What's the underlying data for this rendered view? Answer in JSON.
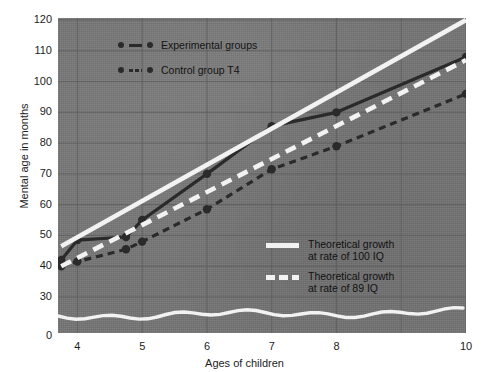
{
  "chart_data": {
    "type": "line",
    "title": "",
    "xlabel": "Ages of children",
    "ylabel": "Mental age in months",
    "xlim": [
      3.7,
      10
    ],
    "ylim": [
      30,
      120
    ],
    "yaxis_break_value": "0",
    "grid": true,
    "legend_position": "inside-top-left and inside-lower-right",
    "x_tick_labels": [
      "4",
      "5",
      "6",
      "7",
      "8",
      "10"
    ],
    "x_tick_values": [
      4,
      5,
      6,
      7,
      8,
      10
    ],
    "y_tick_labels": [
      "120",
      "110",
      "100",
      "90",
      "80",
      "70",
      "60",
      "50",
      "40",
      "30",
      "0"
    ],
    "y_tick_values": [
      120,
      110,
      100,
      90,
      80,
      70,
      60,
      50,
      40,
      30,
      0
    ],
    "series": [
      {
        "name": "Experimental groups",
        "style": "solid-dark-markers",
        "color": "#2a2a2a",
        "x": [
          3.75,
          4.0,
          4.75,
          5.0,
          6.0,
          7.0,
          8.0,
          10.0
        ],
        "values": [
          42,
          48.5,
          49.5,
          55,
          70,
          85.5,
          90,
          108
        ]
      },
      {
        "name": "Control group T4",
        "style": "dashed-dark-markers",
        "color": "#2a2a2a",
        "x": [
          3.75,
          4.0,
          4.75,
          5.0,
          6.0,
          7.0,
          8.0,
          10.0
        ],
        "values": [
          40,
          41.5,
          45.5,
          48,
          58.5,
          71.5,
          79,
          96
        ]
      },
      {
        "name": "Theoretical growth at rate of 100 IQ",
        "style": "solid-white",
        "color": "#f2f2f2",
        "x": [
          3.75,
          10.0
        ],
        "values": [
          46.5,
          120
        ]
      },
      {
        "name": "Theoretical growth at rate of 89 IQ",
        "style": "dashed-white",
        "color": "#f2f2f2",
        "x": [
          3.75,
          10.0
        ],
        "values": [
          40,
          107
        ]
      }
    ]
  },
  "axes": {
    "y_title": "Mental age in months",
    "x_title": "Ages of children"
  },
  "legend_top": {
    "items": [
      {
        "label": "Experimental groups",
        "style": "solid"
      },
      {
        "label": "Control group T4",
        "style": "dashed"
      }
    ]
  },
  "legend_bottom": {
    "items": [
      {
        "line1": "Theoretical growth",
        "line2": "at rate of 100 IQ",
        "style": "solid"
      },
      {
        "line1": "Theoretical growth",
        "line2": "at rate of 89 IQ",
        "style": "dashed"
      }
    ]
  },
  "colors": {
    "panel_background": "#757575",
    "data_dark": "#2a2a2a",
    "data_white": "#f2f2f2",
    "grid": "#5f5f5f",
    "text": "#1d1d1d",
    "page_background": "#ffffff"
  }
}
